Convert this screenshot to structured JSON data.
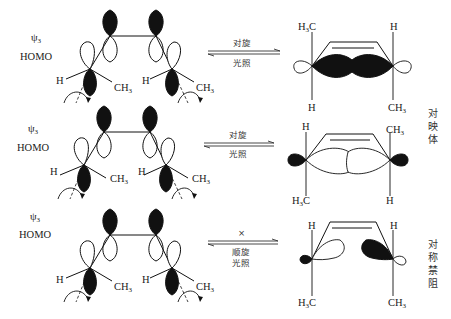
{
  "rows": [
    {
      "orbital_label": "ψ",
      "orbital_subscript": "3",
      "orbital_type": "HOMO",
      "left_substituents": [
        "H",
        "CH3",
        "H",
        "CH3"
      ],
      "arrow_top_label": "对旋",
      "arrow_bottom_label": "光照",
      "product_top_left": "H3C",
      "product_top_right": "H",
      "product_bottom_left": "H",
      "product_bottom_right": "CH3",
      "result_label": ""
    },
    {
      "orbital_label": "ψ",
      "orbital_subscript": "3",
      "orbital_type": "HOMO",
      "left_substituents": [
        "H",
        "CH3",
        "H",
        "CH3"
      ],
      "arrow_top_label": "对旋",
      "arrow_bottom_label": "光照",
      "product_top_left": "H",
      "product_top_right": "CH3",
      "product_bottom_left": "H3C",
      "product_bottom_right": "H",
      "result_label": "对映体"
    },
    {
      "orbital_label": "ψ",
      "orbital_subscript": "3",
      "orbital_type": "HOMO",
      "left_substituents": [
        "H",
        "CH3",
        "H",
        "CH3"
      ],
      "arrow_mark": "×",
      "arrow_top_label": "顺旋",
      "arrow_bottom_label": "光照",
      "product_top_left": "H",
      "product_top_right": "H",
      "product_bottom_left": "H3C",
      "product_bottom_right": "CH3",
      "result_label": "对称禁阻"
    }
  ],
  "text": {
    "psi": "ψ",
    "three": "3",
    "homo": "HOMO",
    "H": "H",
    "C": "C",
    "CH": "CH",
    "sub3": "3",
    "dis": "对旋",
    "con": "顺旋",
    "light": "光照",
    "forbid_mark": "×",
    "enantiomer": [
      "对",
      "映",
      "体"
    ],
    "forbidden": [
      "对",
      "称",
      "禁",
      "阻"
    ]
  }
}
